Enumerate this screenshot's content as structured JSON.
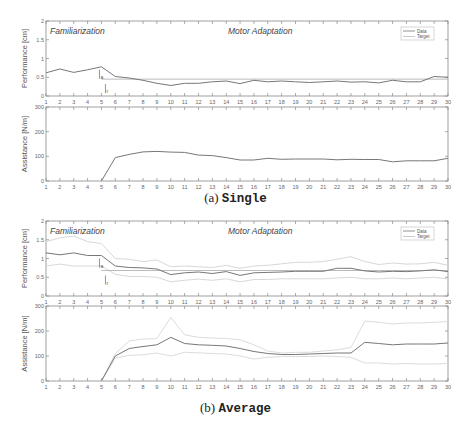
{
  "chart_data": [
    {
      "id": "single",
      "type": "line",
      "caption_prefix": "(a)",
      "caption_name": "Single",
      "x": [
        1,
        2,
        3,
        4,
        5,
        6,
        7,
        8,
        9,
        10,
        11,
        12,
        13,
        14,
        15,
        16,
        17,
        18,
        19,
        20,
        21,
        22,
        23,
        24,
        25,
        26,
        27,
        28,
        29,
        30
      ],
      "phase_labels": [
        "Familiarization",
        "Motor Adaptation"
      ],
      "legend": [
        "Data",
        "Target"
      ],
      "legend_position": "upper right",
      "annotations": [
        "J_a",
        "J_r"
      ],
      "performance": {
        "ylabel": "Performance [cm]",
        "ylim": [
          0,
          2
        ],
        "yticks": [
          0,
          0.5,
          1,
          1.5,
          2
        ],
        "target": 0.45,
        "data": [
          0.62,
          0.72,
          0.63,
          0.7,
          0.78,
          0.52,
          0.48,
          0.42,
          0.34,
          0.28,
          0.34,
          0.34,
          0.38,
          0.4,
          0.33,
          0.42,
          0.38,
          0.4,
          0.38,
          0.36,
          0.38,
          0.4,
          0.37,
          0.38,
          0.35,
          0.42,
          0.38,
          0.38,
          0.52,
          0.5
        ]
      },
      "assistance": {
        "ylabel": "Assistance [N/m]",
        "ylim": [
          0,
          300
        ],
        "yticks": [
          0,
          100,
          200,
          300
        ],
        "data": [
          0,
          0,
          0,
          0,
          0,
          95,
          108,
          118,
          120,
          117,
          116,
          105,
          103,
          95,
          85,
          85,
          92,
          88,
          89,
          89,
          89,
          86,
          88,
          87,
          87,
          78,
          82,
          82,
          82,
          92
        ]
      }
    },
    {
      "id": "average",
      "type": "line",
      "caption_prefix": "(b)",
      "caption_name": "Average",
      "x": [
        1,
        2,
        3,
        4,
        5,
        6,
        7,
        8,
        9,
        10,
        11,
        12,
        13,
        14,
        15,
        16,
        17,
        18,
        19,
        20,
        21,
        22,
        23,
        24,
        25,
        26,
        27,
        28,
        29,
        30
      ],
      "phase_labels": [
        "Familiarization",
        "Motor Adaptation"
      ],
      "legend": [
        "Data",
        "Target"
      ],
      "legend_position": "upper right",
      "annotations": [
        "J_a",
        "J_r"
      ],
      "performance": {
        "ylabel": "Performance [cm]",
        "ylim": [
          0,
          2
        ],
        "yticks": [
          0,
          0.5,
          1,
          1.5,
          2
        ],
        "target": 0.68,
        "data": [
          1.15,
          1.1,
          1.15,
          1.08,
          1.08,
          0.8,
          0.76,
          0.75,
          0.72,
          0.57,
          0.62,
          0.64,
          0.6,
          0.65,
          0.55,
          0.62,
          0.63,
          0.64,
          0.66,
          0.66,
          0.66,
          0.74,
          0.74,
          0.67,
          0.64,
          0.66,
          0.65,
          0.67,
          0.7,
          0.65
        ],
        "upper": [
          1.45,
          1.55,
          1.6,
          1.45,
          1.4,
          1.0,
          0.98,
          0.92,
          0.96,
          0.78,
          0.8,
          0.78,
          0.76,
          0.82,
          0.74,
          0.8,
          0.82,
          0.86,
          0.9,
          0.9,
          0.92,
          0.98,
          1.05,
          0.92,
          0.84,
          0.88,
          0.85,
          0.86,
          0.9,
          0.82
        ],
        "lower": [
          0.8,
          0.85,
          0.8,
          0.8,
          0.8,
          0.58,
          0.52,
          0.52,
          0.5,
          0.38,
          0.42,
          0.45,
          0.42,
          0.46,
          0.38,
          0.44,
          0.44,
          0.46,
          0.46,
          0.46,
          0.46,
          0.48,
          0.5,
          0.46,
          0.46,
          0.48,
          0.46,
          0.48,
          0.5,
          0.46
        ]
      },
      "assistance": {
        "ylabel": "Assistance [N/m]",
        "ylim": [
          0,
          300
        ],
        "yticks": [
          0,
          100,
          200,
          300
        ],
        "data": [
          0,
          0,
          0,
          0,
          0,
          100,
          130,
          138,
          145,
          175,
          150,
          145,
          143,
          140,
          130,
          118,
          110,
          106,
          106,
          108,
          110,
          112,
          112,
          155,
          150,
          145,
          148,
          148,
          148,
          152
        ],
        "upper": [
          0,
          0,
          0,
          0,
          0,
          110,
          160,
          168,
          170,
          255,
          185,
          175,
          172,
          170,
          165,
          145,
          120,
          112,
          115,
          115,
          120,
          125,
          135,
          240,
          235,
          228,
          232,
          232,
          235,
          238
        ],
        "lower": [
          0,
          0,
          0,
          0,
          0,
          92,
          103,
          105,
          112,
          100,
          115,
          113,
          110,
          108,
          100,
          88,
          95,
          98,
          98,
          98,
          100,
          98,
          95,
          72,
          72,
          68,
          70,
          68,
          68,
          70
        ]
      }
    }
  ],
  "captions": {
    "single": {
      "prefix": "(a)",
      "name": "Single"
    },
    "average": {
      "prefix": "(b)",
      "name": "Average"
    }
  }
}
